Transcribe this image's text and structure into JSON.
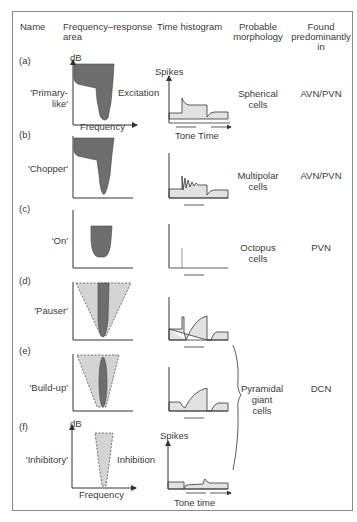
{
  "headers": {
    "name": "Name",
    "frequency_response_line1": "Frequency–response",
    "frequency_response_line2": "area",
    "time_histogram": "Time histogram",
    "morphology_line1": "Probable",
    "morphology_line2": "morphology",
    "found_line1": "Found",
    "found_line2": "predominantly",
    "found_line3": "in"
  },
  "axis_labels": {
    "db": "dB",
    "frequency": "Frequency",
    "spikes": "Spikes",
    "tone_time_a": "Tone Time",
    "tone_time_f": "Tone time",
    "excitation": "Excitation",
    "inhibition": "Inhibition"
  },
  "rows": [
    {
      "letter": "(a)",
      "name_line1": "'Primary-",
      "name_line2": "like'",
      "morph_line1": "Spherical",
      "morph_line2": "cells",
      "found": "AVN/PVN"
    },
    {
      "letter": "(b)",
      "name_line1": "'Chopper'",
      "morph_line1": "Multipolar",
      "morph_line2": "cells",
      "found": "AVN/PVN"
    },
    {
      "letter": "(c)",
      "name_line1": "'On'",
      "morph_line1": "Octopus",
      "morph_line2": "cells",
      "found": "PVN"
    },
    {
      "letter": "(d)",
      "name_line1": "'Pauser'"
    },
    {
      "letter": "(e)",
      "name_line1": "'Build-up'",
      "morph_line1": "Pyramidal",
      "morph_line2": "giant",
      "morph_line3": "cells",
      "found": "DCN"
    },
    {
      "letter": "(f)",
      "name_line1": "'Inhibitory'"
    }
  ],
  "colors": {
    "dark_fill": "#6e6e6e",
    "light_fill": "#d4d4d4",
    "hist_fill": "#e2e2e2",
    "stroke": "#333333",
    "frame": "#8a8a8a"
  }
}
